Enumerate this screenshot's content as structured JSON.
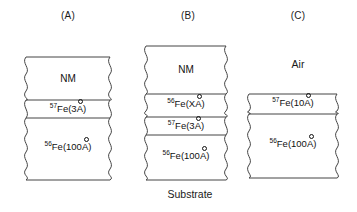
{
  "figure": {
    "caption_below": "Substrate",
    "line_color": "#444444",
    "background": "#ffffff",
    "text_color": "#111111"
  },
  "panels": [
    {
      "id": "A",
      "caption": "(A)",
      "outside_label": null,
      "layers": [
        {
          "name": "NM",
          "text_html": "NM",
          "plain": "NM"
        },
        {
          "name": "fe57-3a",
          "text_html": "<sup>57</sup>Fe(3<span class=\"ang\">A</span>)",
          "plain": "57Fe(3Å)"
        },
        {
          "name": "fe56-100a",
          "text_html": "<sup>56</sup>Fe(100<span class=\"ang\">A</span>)",
          "plain": "56Fe(100Å)"
        }
      ]
    },
    {
      "id": "B",
      "caption": "(B)",
      "outside_label": null,
      "layers": [
        {
          "name": "NM",
          "text_html": "NM",
          "plain": "NM"
        },
        {
          "name": "fe56-xa",
          "text_html": "<sup>56</sup>Fe(X<span class=\"ang\">A</span>)",
          "plain": "56Fe(XÅ)"
        },
        {
          "name": "fe57-3a",
          "text_html": "<sup>57</sup>Fe(3<span class=\"ang\">A</span>)",
          "plain": "57Fe(3Å)"
        },
        {
          "name": "fe56-100a",
          "text_html": "<sup>56</sup>Fe(100<span class=\"ang\">A</span>)",
          "plain": "56Fe(100Å)"
        }
      ]
    },
    {
      "id": "C",
      "caption": "(C)",
      "outside_label": "Air",
      "layers": [
        {
          "name": "fe57-10a",
          "text_html": "<sup>57</sup>Fe(10<span class=\"ang\">A</span>)",
          "plain": "57Fe(10Å)"
        },
        {
          "name": "fe56-100a",
          "text_html": "<sup>56</sup>Fe(100<span class=\"ang\">A</span>)",
          "plain": "56Fe(100Å)"
        }
      ]
    }
  ]
}
